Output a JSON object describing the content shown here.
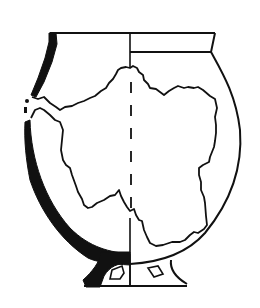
{
  "figure": {
    "colors": {
      "ink": "#111111",
      "background": "#ffffff"
    },
    "parts": [
      {
        "name": "rim",
        "label": ""
      },
      {
        "name": "body",
        "label": ""
      },
      {
        "name": "ring-foot",
        "label": ""
      },
      {
        "name": "center-axis",
        "label": ""
      },
      {
        "name": "sherd-outline",
        "label": ""
      }
    ]
  }
}
